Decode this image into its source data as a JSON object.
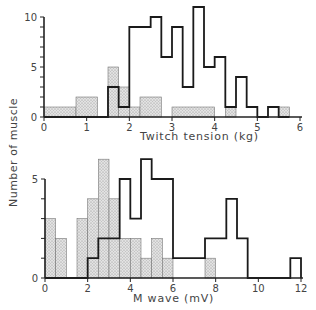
{
  "figure": {
    "ylabel": "Number of muscle",
    "colors": {
      "outline": "#1a1a1a",
      "stipple_fill": "#d8d8d8",
      "stipple_dot": "#888888",
      "axis": "#222222"
    }
  },
  "chart_data": [
    {
      "type": "bar",
      "subtype": "histogram-overlay",
      "xlabel": "Twitch tension (kg)",
      "ylabel": "Number of muscle",
      "xlim": [
        0,
        6
      ],
      "ylim": [
        0,
        11
      ],
      "xticks": [
        0,
        1,
        2,
        3,
        4,
        5,
        6
      ],
      "yticks": [
        0,
        5,
        10
      ],
      "bin_width": 0.25,
      "grid": false,
      "series": [
        {
          "name": "open (outlined)",
          "style": "outline",
          "bins": [
            {
              "x0": 0.0,
              "x1": 1.5,
              "count": 0
            },
            {
              "x0": 1.5,
              "x1": 1.75,
              "count": 3
            },
            {
              "x0": 1.75,
              "x1": 2.0,
              "count": 1
            },
            {
              "x0": 2.0,
              "x1": 2.5,
              "count": 9
            },
            {
              "x0": 2.5,
              "x1": 2.75,
              "count": 10
            },
            {
              "x0": 2.75,
              "x1": 3.0,
              "count": 6
            },
            {
              "x0": 3.0,
              "x1": 3.25,
              "count": 9
            },
            {
              "x0": 3.25,
              "x1": 3.5,
              "count": 3
            },
            {
              "x0": 3.5,
              "x1": 3.75,
              "count": 11
            },
            {
              "x0": 3.75,
              "x1": 4.0,
              "count": 5
            },
            {
              "x0": 4.0,
              "x1": 4.25,
              "count": 6
            },
            {
              "x0": 4.25,
              "x1": 4.5,
              "count": 1
            },
            {
              "x0": 4.5,
              "x1": 4.75,
              "count": 4
            },
            {
              "x0": 4.75,
              "x1": 5.0,
              "count": 1
            },
            {
              "x0": 5.0,
              "x1": 5.25,
              "count": 0
            },
            {
              "x0": 5.25,
              "x1": 5.5,
              "count": 1
            },
            {
              "x0": 5.5,
              "x1": 5.75,
              "count": 0
            }
          ]
        },
        {
          "name": "stippled",
          "style": "stipple",
          "bins": [
            {
              "x0": 0.0,
              "x1": 0.75,
              "count": 1
            },
            {
              "x0": 0.75,
              "x1": 1.25,
              "count": 2
            },
            {
              "x0": 1.25,
              "x1": 1.5,
              "count": 0
            },
            {
              "x0": 1.5,
              "x1": 1.75,
              "count": 5
            },
            {
              "x0": 1.75,
              "x1": 2.0,
              "count": 3
            },
            {
              "x0": 2.0,
              "x1": 2.25,
              "count": 1
            },
            {
              "x0": 2.25,
              "x1": 2.75,
              "count": 2
            },
            {
              "x0": 2.75,
              "x1": 3.0,
              "count": 0
            },
            {
              "x0": 3.0,
              "x1": 4.0,
              "count": 1
            },
            {
              "x0": 4.0,
              "x1": 4.25,
              "count": 0
            },
            {
              "x0": 4.25,
              "x1": 4.5,
              "count": 1
            },
            {
              "x0": 4.5,
              "x1": 5.5,
              "count": 0
            },
            {
              "x0": 5.5,
              "x1": 5.75,
              "count": 1
            }
          ]
        }
      ]
    },
    {
      "type": "bar",
      "subtype": "histogram-overlay",
      "xlabel": "M wave (mV)",
      "ylabel": "Number of muscle",
      "xlim": [
        0,
        12
      ],
      "ylim": [
        0,
        6
      ],
      "xticks": [
        0,
        2,
        4,
        6,
        8,
        10,
        12
      ],
      "yticks": [
        0,
        5
      ],
      "bin_width": 0.5,
      "grid": false,
      "series": [
        {
          "name": "open (outlined)",
          "style": "outline",
          "bins": [
            {
              "x0": 0.0,
              "x1": 2.0,
              "count": 0
            },
            {
              "x0": 2.0,
              "x1": 2.5,
              "count": 1
            },
            {
              "x0": 2.5,
              "x1": 3.5,
              "count": 2
            },
            {
              "x0": 3.5,
              "x1": 4.0,
              "count": 5
            },
            {
              "x0": 4.0,
              "x1": 4.5,
              "count": 3
            },
            {
              "x0": 4.5,
              "x1": 5.0,
              "count": 6
            },
            {
              "x0": 5.0,
              "x1": 6.0,
              "count": 5
            },
            {
              "x0": 6.0,
              "x1": 7.5,
              "count": 1
            },
            {
              "x0": 7.5,
              "x1": 8.5,
              "count": 2
            },
            {
              "x0": 8.5,
              "x1": 9.0,
              "count": 4
            },
            {
              "x0": 9.0,
              "x1": 9.5,
              "count": 2
            },
            {
              "x0": 9.5,
              "x1": 11.5,
              "count": 0
            },
            {
              "x0": 11.5,
              "x1": 12.0,
              "count": 1
            }
          ]
        },
        {
          "name": "stippled",
          "style": "stipple",
          "bins": [
            {
              "x0": 0.0,
              "x1": 0.5,
              "count": 3
            },
            {
              "x0": 0.5,
              "x1": 1.0,
              "count": 2
            },
            {
              "x0": 1.0,
              "x1": 1.5,
              "count": 0
            },
            {
              "x0": 1.5,
              "x1": 2.0,
              "count": 3
            },
            {
              "x0": 2.0,
              "x1": 2.5,
              "count": 4
            },
            {
              "x0": 2.5,
              "x1": 3.0,
              "count": 6
            },
            {
              "x0": 3.0,
              "x1": 3.5,
              "count": 4
            },
            {
              "x0": 3.5,
              "x1": 4.0,
              "count": 2
            },
            {
              "x0": 4.0,
              "x1": 4.5,
              "count": 2
            },
            {
              "x0": 4.5,
              "x1": 5.0,
              "count": 1
            },
            {
              "x0": 5.0,
              "x1": 5.5,
              "count": 2
            },
            {
              "x0": 5.5,
              "x1": 6.0,
              "count": 1
            },
            {
              "x0": 6.0,
              "x1": 7.5,
              "count": 0
            },
            {
              "x0": 7.5,
              "x1": 8.0,
              "count": 1
            }
          ]
        }
      ]
    }
  ]
}
